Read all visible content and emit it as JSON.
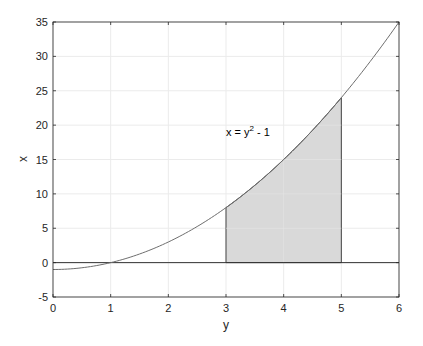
{
  "chart_data": {
    "type": "area",
    "title": "",
    "xlabel": "y",
    "ylabel": "x",
    "xlim": [
      0,
      6
    ],
    "ylim": [
      -5,
      35
    ],
    "xticks": [
      0,
      1,
      2,
      3,
      4,
      5,
      6
    ],
    "yticks": [
      -5,
      0,
      5,
      10,
      15,
      20,
      25,
      30,
      35
    ],
    "grid": true,
    "legend": null,
    "series": [
      {
        "name": "x = y^2 - 1",
        "type": "line",
        "function": "y^2 - 1",
        "x": [
          0,
          0.5,
          1,
          1.5,
          2,
          2.5,
          3,
          3.5,
          4,
          4.5,
          5,
          5.5,
          6
        ],
        "values": [
          -1,
          -0.75,
          0,
          1.25,
          3,
          5.25,
          8,
          11.25,
          15,
          19.25,
          24,
          29.25,
          35
        ]
      },
      {
        "name": "x = 0",
        "type": "line",
        "x": [
          0,
          6
        ],
        "values": [
          0,
          0
        ]
      },
      {
        "name": "shaded region",
        "type": "area",
        "x_range": [
          3,
          5
        ],
        "lower": 0,
        "upper": "y^2 - 1",
        "color": "#d9d9d9"
      }
    ],
    "annotations": [
      {
        "text": "x = y",
        "superscript": "2",
        "suffix": " - 1",
        "at": [
          3.0,
          20
        ]
      }
    ]
  },
  "labels": {
    "xlabel": "y",
    "ylabel": "x",
    "annotation_main": "x = y",
    "annotation_sup": "2",
    "annotation_suffix": " - 1",
    "xticks": [
      "0",
      "1",
      "2",
      "3",
      "4",
      "5",
      "6"
    ],
    "yticks": [
      "35",
      "30",
      "25",
      "20",
      "15",
      "10",
      "5",
      "0",
      "-5"
    ]
  },
  "colors": {
    "curve": "#6e6e6e",
    "fill": "#d9d9d9",
    "axis": "#262626",
    "grid": "#ebebeb"
  }
}
